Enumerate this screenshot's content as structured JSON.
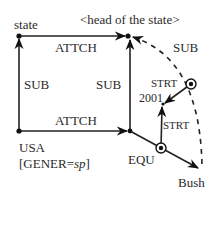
{
  "diagram": {
    "nodes": {
      "state": "state",
      "head": "<head of the state>",
      "usa_line1": "USA",
      "usa_line2_prefix": "[GENER=",
      "usa_line2_value": "sp",
      "usa_line2_suffix": "]",
      "year": "2001",
      "bush": "Bush"
    },
    "edges": {
      "attch_top": "ATTCH",
      "attch_bottom": "ATTCH",
      "sub_left": "SUB",
      "sub_middle": "SUB",
      "sub_arc": "SUB",
      "strt_upper": "STRT",
      "strt_lower": "STRT",
      "equ": "EQU"
    }
  }
}
